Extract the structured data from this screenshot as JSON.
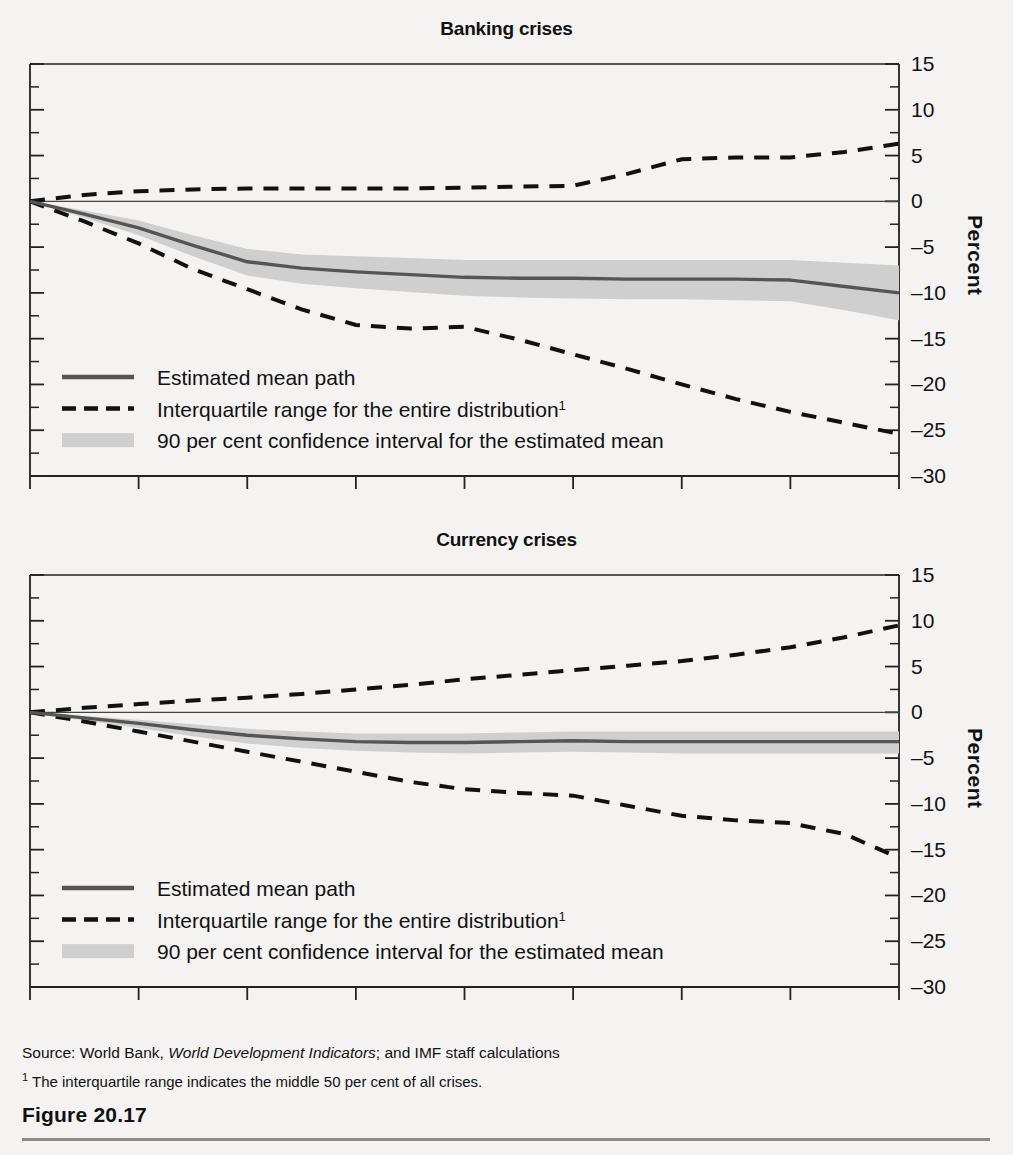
{
  "figure": {
    "caption": "Figure 20.17",
    "source": "Source: World Bank, ",
    "source_italic": "World Development Indicators",
    "source_tail": "; and IMF staff calculations",
    "footnote_mark": "1",
    "footnote": " The interquartile range indicates the middle 50 per cent of all crises.",
    "axis_label": "Percent"
  },
  "colors": {
    "mean_line": "#555555",
    "band": "#cfcfcf",
    "dashed": "#111111",
    "axis": "#222222",
    "background": "#f4f3f1",
    "rule": "#8a8a8a"
  },
  "legend": {
    "items": [
      {
        "key": "mean",
        "label": "Estimated mean path",
        "marker": "solid-line"
      },
      {
        "key": "iqr",
        "label": "Interquartile range for the entire distribution",
        "marker": "dashed-line",
        "sup": "1"
      },
      {
        "key": "ci",
        "label": "90 per cent confidence interval for the estimated mean",
        "marker": "shaded-band"
      }
    ]
  },
  "chart_data": [
    {
      "type": "line",
      "title": "Banking crises",
      "xlabel": "",
      "ylabel": "Percent",
      "xlim": [
        -1,
        7
      ],
      "ylim": [
        -30,
        15
      ],
      "xticks": [
        -1,
        0,
        1,
        2,
        3,
        4,
        5,
        6,
        7
      ],
      "xticklabels": [
        "–1",
        "0",
        "1",
        "2",
        "3",
        "4",
        "5",
        "6",
        "7"
      ],
      "yticks": [
        15,
        10,
        5,
        0,
        -5,
        -10,
        -15,
        -20,
        -25,
        -30
      ],
      "yticklabels": [
        "15",
        "10",
        "5",
        "0",
        "–5",
        "–10",
        "–15",
        "–20",
        "–25",
        "–30"
      ],
      "y_minor_step": 2.5,
      "grid": false,
      "zero_line": true,
      "legend_position": "lower-left-inside",
      "x": [
        -1,
        -0.5,
        0,
        0.5,
        1,
        1.5,
        2,
        2.5,
        3,
        3.5,
        4,
        4.5,
        5,
        5.5,
        6,
        6.5,
        7
      ],
      "series": [
        {
          "name": "Estimated mean path",
          "style": "solid",
          "values": [
            0,
            -1.4,
            -2.9,
            -4.8,
            -6.6,
            -7.3,
            -7.7,
            -8.0,
            -8.3,
            -8.4,
            -8.4,
            -8.5,
            -8.5,
            -8.5,
            -8.6,
            -9.3,
            -10.0
          ]
        },
        {
          "name": "Upper quartile (75th percentile)",
          "style": "dashed",
          "values": [
            0,
            0.7,
            1.1,
            1.3,
            1.4,
            1.4,
            1.4,
            1.4,
            1.5,
            1.6,
            1.7,
            3.0,
            4.6,
            4.8,
            4.8,
            5.4,
            6.3
          ]
        },
        {
          "name": "Lower quartile (25th percentile)",
          "style": "dashed",
          "values": [
            0,
            -2.2,
            -4.6,
            -7.4,
            -9.6,
            -11.8,
            -13.5,
            -13.9,
            -13.7,
            -15.1,
            -16.7,
            -18.3,
            -20.0,
            -21.6,
            -23.0,
            -24.2,
            -25.4
          ]
        },
        {
          "name": "90 per cent confidence interval upper",
          "style": "band-upper",
          "values": [
            0,
            -1.0,
            -2.1,
            -3.7,
            -5.2,
            -5.8,
            -6.0,
            -6.2,
            -6.4,
            -6.4,
            -6.4,
            -6.4,
            -6.4,
            -6.4,
            -6.4,
            -6.7,
            -7.0
          ]
        },
        {
          "name": "90 per cent confidence interval lower",
          "style": "band-lower",
          "values": [
            0,
            -1.8,
            -3.7,
            -6.0,
            -8.1,
            -9.0,
            -9.5,
            -9.9,
            -10.3,
            -10.5,
            -10.6,
            -10.7,
            -10.7,
            -10.8,
            -10.9,
            -11.9,
            -13.0
          ]
        }
      ]
    },
    {
      "type": "line",
      "title": "Currency crises",
      "xlabel": "",
      "ylabel": "Percent",
      "xlim": [
        -1,
        7
      ],
      "ylim": [
        -30,
        15
      ],
      "xticks": [
        -1,
        0,
        1,
        2,
        3,
        4,
        5,
        6,
        7
      ],
      "xticklabels": [
        "–1",
        "0",
        "1",
        "2",
        "3",
        "4",
        "5",
        "6",
        "7"
      ],
      "yticks": [
        15,
        10,
        5,
        0,
        -5,
        -10,
        -15,
        -20,
        -25,
        -30
      ],
      "yticklabels": [
        "15",
        "10",
        "5",
        "0",
        "–5",
        "–10",
        "–15",
        "–20",
        "–25",
        "–30"
      ],
      "y_minor_step": 2.5,
      "grid": false,
      "zero_line": true,
      "legend_position": "lower-left-inside",
      "x": [
        -1,
        -0.5,
        0,
        0.5,
        1,
        1.5,
        2,
        2.5,
        3,
        3.5,
        4,
        4.5,
        5,
        5.5,
        6,
        6.5,
        7
      ],
      "series": [
        {
          "name": "Estimated mean path",
          "style": "solid",
          "values": [
            0,
            -0.6,
            -1.2,
            -1.9,
            -2.5,
            -2.9,
            -3.2,
            -3.3,
            -3.3,
            -3.2,
            -3.1,
            -3.2,
            -3.2,
            -3.2,
            -3.2,
            -3.2,
            -3.2
          ]
        },
        {
          "name": "Upper quartile (75th percentile)",
          "style": "dashed",
          "values": [
            0,
            0.5,
            0.9,
            1.3,
            1.6,
            2.0,
            2.5,
            3.0,
            3.6,
            4.1,
            4.6,
            5.1,
            5.6,
            6.3,
            7.1,
            8.2,
            9.5
          ]
        },
        {
          "name": "Lower quartile (25th percentile)",
          "style": "dashed",
          "values": [
            0,
            -1.0,
            -2.1,
            -3.2,
            -4.3,
            -5.4,
            -6.5,
            -7.6,
            -8.4,
            -8.8,
            -9.1,
            -10.2,
            -11.3,
            -11.8,
            -12.1,
            -13.3,
            -15.9
          ]
        },
        {
          "name": "90 per cent confidence interval upper",
          "style": "band-upper",
          "values": [
            0,
            -0.4,
            -0.8,
            -1.3,
            -1.8,
            -2.1,
            -2.3,
            -2.3,
            -2.3,
            -2.2,
            -2.1,
            -2.1,
            -2.1,
            -2.1,
            -2.1,
            -2.1,
            -2.1
          ]
        },
        {
          "name": "90 per cent confidence interval lower",
          "style": "band-lower",
          "values": [
            0,
            -0.9,
            -1.7,
            -2.6,
            -3.4,
            -3.9,
            -4.2,
            -4.4,
            -4.5,
            -4.4,
            -4.3,
            -4.4,
            -4.5,
            -4.5,
            -4.5,
            -4.5,
            -4.5
          ]
        }
      ]
    }
  ]
}
